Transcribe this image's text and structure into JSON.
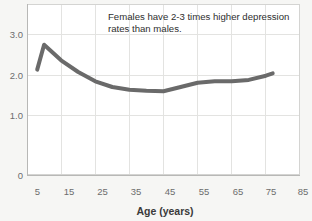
{
  "chart_data": {
    "type": "line",
    "title": "",
    "subtitle": "",
    "xlabel": "Age (years)",
    "ylabel": "",
    "xlim": [
      5,
      85
    ],
    "ylim": [
      0,
      3.2
    ],
    "grid": true,
    "legend": false,
    "legend_position": "none",
    "x_ticks": [
      5,
      15,
      25,
      35,
      45,
      55,
      65,
      75,
      85
    ],
    "x_tick_labels": [
      "5",
      "15",
      "25",
      "35",
      "45",
      "55",
      "65",
      "75",
      "85"
    ],
    "y_ticks": [
      0,
      1.0,
      2.0,
      3.0
    ],
    "y_tick_labels": [
      "0",
      "1.0",
      "2.0",
      "3.0"
    ],
    "series": [
      {
        "name": "Female-to-male depression rate ratio",
        "color": "#6a6a6a",
        "x": [
          8,
          10,
          15,
          20,
          25,
          30,
          35,
          40,
          45,
          50,
          55,
          60,
          65,
          70,
          75,
          77
        ],
        "values": [
          2.25,
          2.78,
          2.45,
          2.2,
          2.0,
          1.88,
          1.82,
          1.8,
          1.79,
          1.88,
          1.97,
          2.0,
          2.0,
          2.03,
          2.12,
          2.17
        ]
      }
    ],
    "annotations": [
      {
        "name": "females-higher-rates-note",
        "line1": "Females have 2-3 times higher depression",
        "line2": "rates than males.",
        "x": 30,
        "y": 3.05
      }
    ]
  },
  "axis": {
    "x_title": "Age (years)"
  }
}
